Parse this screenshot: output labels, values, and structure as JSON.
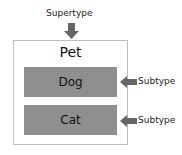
{
  "diagram": {
    "supertype_label": "Supertype",
    "container": {
      "title": "Pet"
    },
    "subtypes": [
      {
        "name": "Dog",
        "annotation": "Subtype"
      },
      {
        "name": "Cat",
        "annotation": "Subtype"
      }
    ],
    "colors": {
      "box_fill": "#8f8f8f",
      "arrow": "#666666",
      "container_border": "#bdbdbd"
    }
  }
}
